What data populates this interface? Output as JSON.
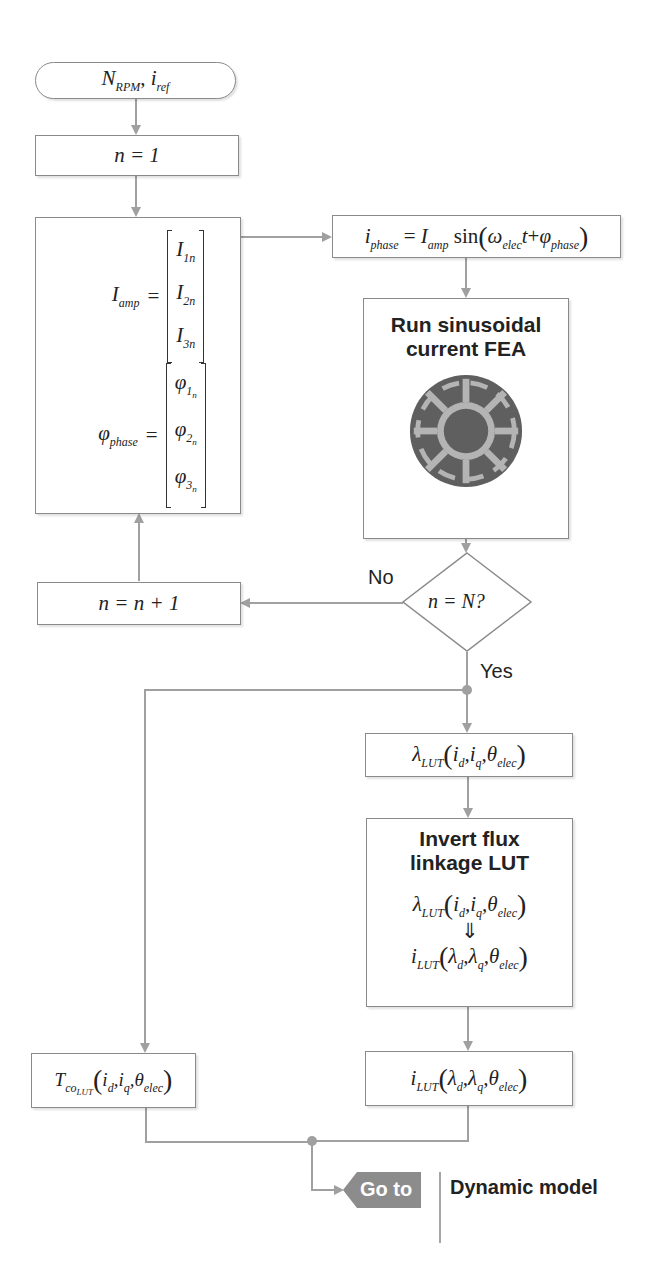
{
  "diagram": {
    "type": "flowchart",
    "start": {
      "label": "N_RPM, i_ref",
      "main_a": "N",
      "sub_a": "RPM",
      "sep": ", ",
      "main_b": "i",
      "sub_b": "ref"
    },
    "init": {
      "label": "n = 1",
      "text": "n = 1"
    },
    "amplitude_phase": {
      "iamp_lhs_main": "I",
      "iamp_lhs_sub": "amp",
      "iamp_rows": [
        {
          "main": "I",
          "sub": "1n"
        },
        {
          "main": "I",
          "sub": "2n"
        },
        {
          "main": "I",
          "sub": "3n"
        }
      ],
      "phi_lhs_main": "φ",
      "phi_lhs_sub": "phase",
      "phi_rows": [
        {
          "main": "φ",
          "sub": "1",
          "subsub": "n"
        },
        {
          "main": "φ",
          "sub": "2",
          "subsub": "n"
        },
        {
          "main": "φ",
          "sub": "3",
          "subsub": "n"
        }
      ],
      "equals": "="
    },
    "phase_current": {
      "label": "i_phase = I_amp sin(ω_elec t + φ_phase)",
      "i": "i",
      "i_sub": "phase",
      "eq": "=",
      "I": "I",
      "I_sub": "amp",
      "sin": "sin",
      "omega": "ω",
      "omega_sub": "elec",
      "t": "t",
      "plus": "+",
      "phi": "φ",
      "phi_sub": "phase"
    },
    "fea": {
      "title_line1": "Run sinusoidal",
      "title_line2": "current FEA",
      "image": "motor-cross-section"
    },
    "decision": {
      "label": "n = N?",
      "text": "n = N?",
      "no": "No",
      "yes": "Yes"
    },
    "increment": {
      "label": "n = n + 1",
      "text": "n = n + 1"
    },
    "flux_lut": {
      "label": "λ_LUT(i_d, i_q, θ_elec)",
      "main": "λ",
      "sub": "LUT",
      "args": [
        {
          "main": "i",
          "sub": "d"
        },
        {
          "main": "i",
          "sub": "q"
        },
        {
          "main": "θ",
          "sub": "elec"
        }
      ]
    },
    "invert": {
      "title_line1": "Invert flux",
      "title_line2": "linkage LUT",
      "from": {
        "main": "λ",
        "sub": "LUT",
        "args": [
          {
            "main": "i",
            "sub": "d"
          },
          {
            "main": "i",
            "sub": "q"
          },
          {
            "main": "θ",
            "sub": "elec"
          }
        ]
      },
      "arrow": "⇓",
      "to": {
        "main": "i",
        "sub": "LUT",
        "args": [
          {
            "main": "λ",
            "sub": "d"
          },
          {
            "main": "λ",
            "sub": "q"
          },
          {
            "main": "θ",
            "sub": "elec"
          }
        ]
      }
    },
    "torque_lut": {
      "label": "T_co_LUT(i_d, i_q, θ_elec)",
      "main": "T",
      "sub": "co",
      "subsub": "LUT",
      "args": [
        {
          "main": "i",
          "sub": "d"
        },
        {
          "main": "i",
          "sub": "q"
        },
        {
          "main": "θ",
          "sub": "elec"
        }
      ]
    },
    "current_lut": {
      "label": "i_LUT(λ_d, λ_q, θ_elec)",
      "main": "i",
      "sub": "LUT",
      "args": [
        {
          "main": "λ",
          "sub": "d"
        },
        {
          "main": "λ",
          "sub": "q"
        },
        {
          "main": "θ",
          "sub": "elec"
        }
      ]
    },
    "goto": {
      "label": "Go to",
      "target": "Dynamic model"
    },
    "colors": {
      "line": "#9a9a9a",
      "border": "#8a8a8a",
      "goto_fill": "#8c8c8c",
      "text": "#222222"
    }
  }
}
